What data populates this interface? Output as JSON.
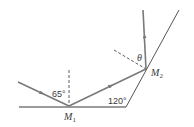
{
  "diagram": {
    "type": "two-mirror reflection",
    "colors": {
      "ray": "#7a7a7a",
      "mirror": "#555555",
      "normal": "#333333",
      "text": "#3a3a3a"
    },
    "labels": {
      "incidence_angle": "65°",
      "mirror_angle": "120°",
      "unknown_angle": "θ",
      "mirror1": {
        "letter": "M",
        "subscript": "1"
      },
      "mirror2": {
        "letter": "M",
        "subscript": "2"
      }
    }
  }
}
